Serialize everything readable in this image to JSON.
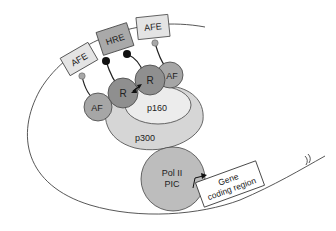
{
  "diagram": {
    "elements": {
      "afe_left": "AFE",
      "hre": "HRE",
      "afe_right": "AFE",
      "receptor_left": "R",
      "receptor_right": "R",
      "af_left": "AF",
      "af_right": "AF",
      "p160": "p160",
      "p300": "p300",
      "pol2_line1": "Pol II",
      "pol2_line2": "PIC",
      "gene_line1": "Gene",
      "gene_line2": "coding region"
    },
    "colors": {
      "box_light": "#e4e4e4",
      "box_dark": "#a9a9a9",
      "receptor": "#8f8f8f",
      "af": "#a6a6a6",
      "p160": "#ececec",
      "p300": "#d6d6d6",
      "pol2": "#bdbdbd",
      "dot_black": "#111111",
      "dot_grey": "#a8a8a8",
      "line": "#333333"
    }
  }
}
